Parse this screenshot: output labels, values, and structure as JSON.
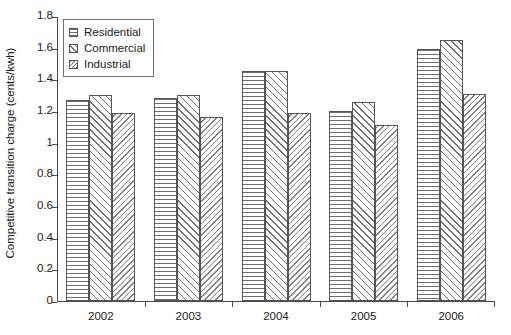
{
  "chart_data": {
    "type": "bar",
    "title": "",
    "xlabel": "",
    "ylabel": "Competitive transition charge (cents/kwh)",
    "categories": [
      "2002",
      "2003",
      "2004",
      "2005",
      "2006"
    ],
    "series": [
      {
        "name": "Residential",
        "pattern": "horizontal-lines",
        "values": [
          1.27,
          1.28,
          1.45,
          1.2,
          1.59
        ]
      },
      {
        "name": "Commercial",
        "pattern": "diagonal-up-hatch",
        "values": [
          1.3,
          1.3,
          1.45,
          1.26,
          1.65
        ]
      },
      {
        "name": "Industrial",
        "pattern": "diagonal-down-hatch",
        "values": [
          1.19,
          1.16,
          1.19,
          1.11,
          1.31
        ]
      }
    ],
    "ylim": [
      0,
      1.8
    ],
    "ytick_labels": [
      "0",
      "0.2",
      "0.4",
      "0.6",
      "0.8",
      "1",
      "1.2",
      "1.4",
      "1.6",
      "1.8"
    ],
    "ytick_values": [
      0,
      0.2,
      0.4,
      0.6,
      0.8,
      1.0,
      1.2,
      1.4,
      1.6,
      1.8
    ],
    "grid": false,
    "legend_position": "top-left",
    "bar_edge_color": "#555555",
    "bar_fill_color": "#ffffff",
    "axis_color": "#4a4a4a",
    "text_color": "#1a1a1a"
  }
}
